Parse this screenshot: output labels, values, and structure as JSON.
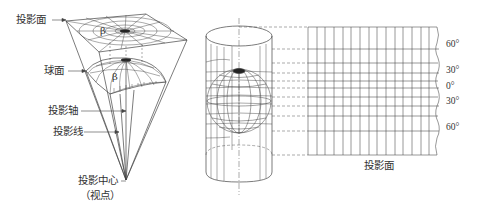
{
  "left_diagram": {
    "labels": {
      "projection_plane": "投影面",
      "sphere": "球面",
      "projection_axis": "投影轴",
      "projection_line": "投影线",
      "projection_center": "投影中心",
      "viewpoint": "（视点）",
      "beta_top": "β",
      "beta_sphere": "β"
    }
  },
  "right_diagram": {
    "plane_label": "投影面",
    "latitude_labels": [
      "60°",
      "30°",
      "0°",
      "30°",
      "60°"
    ]
  },
  "colors": {
    "line": "#444444",
    "dash": "#555555",
    "text": "#333333"
  }
}
